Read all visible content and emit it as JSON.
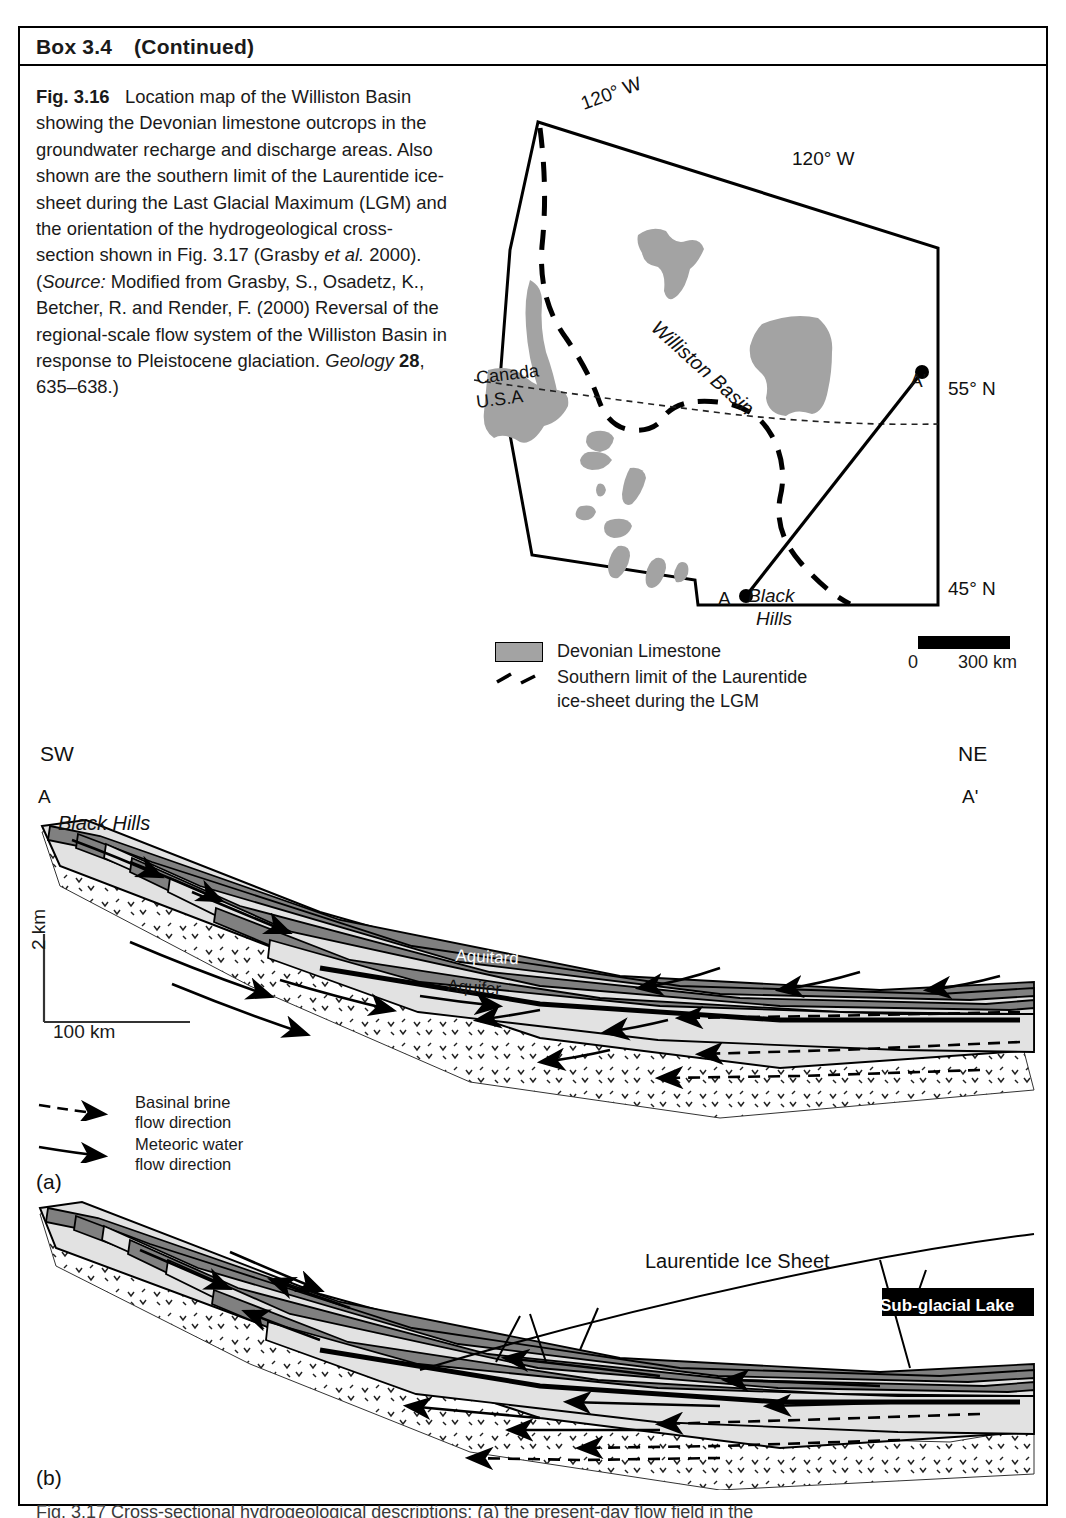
{
  "box": {
    "label": "Box 3.4",
    "continued": "(Continued)"
  },
  "figure_caption": {
    "figure_number": "Fig. 3.16",
    "text": "Location map of the Williston Basin showing the Devonian limestone outcrops in the groundwater recharge and discharge areas. Also shown are the southern limit of the Laurentide ice-sheet during the Last Glacial Maximum (LGM) and the orientation of the hydrogeological cross-section shown in Fig. 3.17 (Grasby et al. 2000). (Source: Modified from Grasby, S., Osadetz, K., Betcher, R. and Render, F. (2000) Reversal of the regional-scale flow system of the Williston Basin in response to Pleistocene glaciation. Geology 28, 635–638.)",
    "source_label": "Source:",
    "italic_etal": "et al.",
    "journal": "Geology",
    "volume": "28",
    "pages": "635–638.)"
  },
  "map": {
    "labels": {
      "lon_top_left": "120° W",
      "lon_top_right": "120° W",
      "lat_upper": "55° N",
      "lat_lower": "45° N",
      "basin_name": "Williston Basin",
      "country_north": "Canada",
      "country_south": "U.S.A",
      "black_hills_line1": "Black",
      "black_hills_line2": "Hills",
      "section_start": "A",
      "section_end": "A'"
    },
    "legend": {
      "limestone_label": "Devonian Limestone",
      "limestone_color": "#a3a3a3",
      "icelimit_label_line1": "Southern limit of the Laurentide",
      "icelimit_label_line2": "ice-sheet during the LGM"
    },
    "scalebar": {
      "zero": "0",
      "max": "300 km"
    }
  },
  "cross_section": {
    "direction_left": "SW",
    "direction_right": "NE",
    "point_left": "A",
    "point_right": "A'",
    "feature_label": "Black Hills",
    "vertical_scale": "2 km",
    "horizontal_scale": "100 km",
    "unit_labels": {
      "aquitard": "Aquitard",
      "aquifer": "Aquifer"
    },
    "flow_legend": [
      {
        "style": "dashed",
        "line1": "Basinal brine",
        "line2": "flow direction"
      },
      {
        "style": "solid",
        "line1": "Meteoric water",
        "line2": "flow direction"
      }
    ],
    "panel_a": "(a)",
    "panel_b": "(b)",
    "ice_sheet_label": "Laurentide Ice Sheet",
    "subglacial_lake_label": "Sub-glacial Lake",
    "colors": {
      "aquitard_dark": "#808080",
      "aquifer_light": "#e2e2e2",
      "basement_stipple": "#ffffff",
      "outline": "#000000"
    }
  },
  "bottom_caption": {
    "text": "Fig. 3.17   Cross-sectional hydrogeological descriptions: (a) the present-day flow field in the"
  }
}
